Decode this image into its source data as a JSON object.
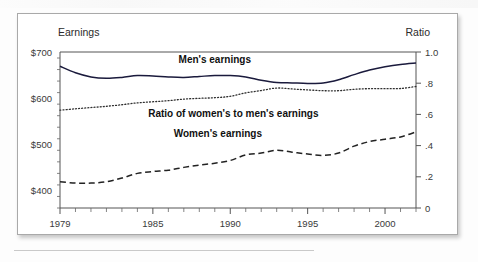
{
  "figure": {
    "background_color": "#ffffff",
    "card_border_color": "#a9a9a9"
  },
  "chart_data": {
    "type": "line",
    "title": "",
    "xlabel": "",
    "ylabel": "Earnings",
    "y2label": "Ratio",
    "grid": false,
    "legend_position": "inline-annotations",
    "x": [
      1979,
      1980,
      1981,
      1982,
      1983,
      1984,
      1985,
      1986,
      1987,
      1988,
      1989,
      1990,
      1991,
      1992,
      1993,
      1994,
      1995,
      1996,
      1997,
      1998,
      1999,
      2000,
      2001,
      2002
    ],
    "xlim": [
      1979,
      2002
    ],
    "xticks_major": [
      1979,
      1985,
      1990,
      1995,
      2000
    ],
    "xtick_labels": [
      "1979",
      "1985",
      "1990",
      "1995",
      "2000"
    ],
    "ylim": [
      362,
      700
    ],
    "yticks_major": [
      400,
      500,
      600,
      700
    ],
    "ytick_labels": [
      "$400",
      "$500",
      "$600",
      "$700"
    ],
    "ytick_minor_step": 25,
    "y2lim": [
      0,
      1.0
    ],
    "y2ticks_major": [
      0,
      0.2,
      0.4,
      0.6,
      0.8,
      1.0
    ],
    "y2tick_labels": [
      "0",
      ".2",
      ".4",
      ".6",
      ".8",
      "1.0"
    ],
    "series": [
      {
        "name": "Men's earnings",
        "axis": "left",
        "style": "solid",
        "color": "#1a1a3c",
        "label_text": "Men's earnings",
        "label_x": 1989.0,
        "label_y": 676,
        "values": [
          669,
          655,
          646,
          643,
          645,
          649,
          648,
          646,
          645,
          647,
          649,
          649,
          646,
          639,
          634,
          633,
          632,
          633,
          640,
          651,
          661,
          668,
          673,
          676
        ]
      },
      {
        "name": "Ratio of women's to men's earnings",
        "axis": "right",
        "style": "dotted",
        "color": "#2f2f2f",
        "label_text": "Ratio of women's to men's earnings",
        "label_x": 1990.2,
        "label_y_ratio": 0.585,
        "values": [
          0.627,
          0.636,
          0.644,
          0.652,
          0.662,
          0.674,
          0.681,
          0.688,
          0.698,
          0.703,
          0.707,
          0.716,
          0.738,
          0.753,
          0.769,
          0.763,
          0.757,
          0.752,
          0.752,
          0.761,
          0.765,
          0.765,
          0.766,
          0.779
        ]
      },
      {
        "name": "Women's earnings",
        "axis": "left",
        "style": "dashed",
        "color": "#222222",
        "label_text": "Women's earnings",
        "label_x": 1989.2,
        "label_y": 516,
        "values": [
          419,
          416,
          416,
          419,
          427,
          437,
          441,
          444,
          450,
          455,
          459,
          465,
          477,
          481,
          487,
          483,
          479,
          476,
          481,
          496,
          506,
          511,
          516,
          527
        ]
      }
    ]
  },
  "axes": {
    "left_title": "Earnings",
    "right_title": "Ratio"
  }
}
